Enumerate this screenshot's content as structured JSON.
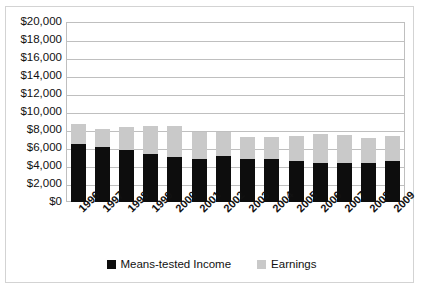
{
  "chart_data": {
    "type": "bar",
    "subtype": "stacked-bar",
    "title": "",
    "xlabel": "",
    "ylabel": "",
    "ylim": [
      0,
      20000
    ],
    "ytick_step": 2000,
    "grid": true,
    "legend_position": "bottom",
    "categories": [
      "1996",
      "1997",
      "1998",
      "1999",
      "2000",
      "2001",
      "2002",
      "2003",
      "2004",
      "2005",
      "2006",
      "2007",
      "2008",
      "2009"
    ],
    "series": [
      {
        "name": "Means-tested Income",
        "color": "#0d0d0d",
        "values": [
          6500,
          6150,
          5730,
          5280,
          5020,
          4830,
          5060,
          4790,
          4760,
          4570,
          4380,
          4380,
          4310,
          4610
        ]
      },
      {
        "name": "Earnings",
        "color": "#c9c9c9",
        "values": [
          2190,
          2015,
          2620,
          3145,
          3480,
          2960,
          2730,
          2440,
          2430,
          2810,
          3150,
          3040,
          2770,
          2730
        ]
      }
    ],
    "totals": [
      8690,
      8165,
      8350,
      8425,
      8500,
      7790,
      7790,
      7230,
      7190,
      7380,
      7530,
      7420,
      7080,
      7340
    ],
    "ytick_labels": [
      "$20,000",
      "$18,000",
      "$16,000",
      "$14,000",
      "$12,000",
      "$10,000",
      "$8,000",
      "$6,000",
      "$4,000",
      "$2,000",
      "$0"
    ],
    "ytick_values": [
      20000,
      18000,
      16000,
      14000,
      12000,
      10000,
      8000,
      6000,
      4000,
      2000,
      0
    ]
  },
  "legend": {
    "items": [
      {
        "label": "Means-tested Income",
        "color": "#0d0d0d"
      },
      {
        "label": "Earnings",
        "color": "#c9c9c9"
      }
    ]
  },
  "title_clipped": ""
}
